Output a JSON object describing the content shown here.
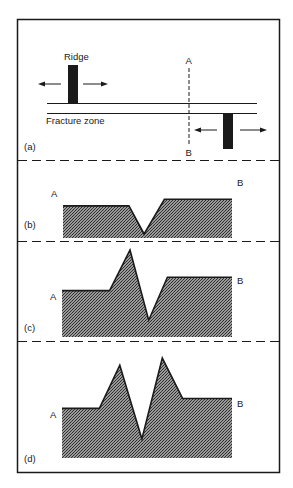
{
  "figure": {
    "panel_a": {
      "label": "(a)",
      "ridge_label": "Ridge",
      "fracture_zone_label": "Fracture zone",
      "profile_start_label": "A",
      "profile_end_label": "B"
    },
    "panel_b": {
      "label": "(b)",
      "start_label": "A",
      "end_label": "B",
      "profile": [
        [
          0,
          0.55
        ],
        [
          0.39,
          0.55
        ],
        [
          0.48,
          0.0
        ],
        [
          0.6,
          0.68
        ],
        [
          1.0,
          0.68
        ]
      ]
    },
    "panel_c": {
      "label": "(c)",
      "start_label": "A",
      "end_label": "B",
      "profile": [
        [
          0,
          0.48
        ],
        [
          0.28,
          0.48
        ],
        [
          0.4,
          1.0
        ],
        [
          0.51,
          0.1
        ],
        [
          0.62,
          0.65
        ],
        [
          1.0,
          0.65
        ]
      ]
    },
    "panel_d": {
      "label": "(d)",
      "start_label": "A",
      "end_label": "B",
      "profile": [
        [
          0,
          0.44
        ],
        [
          0.22,
          0.44
        ],
        [
          0.34,
          0.92
        ],
        [
          0.47,
          0.1
        ],
        [
          0.59,
          1.0
        ],
        [
          0.71,
          0.55
        ],
        [
          1.0,
          0.55
        ]
      ]
    },
    "colors": {
      "ink": "#1a1a1a",
      "fill": "#6e6e6e",
      "background": "#ffffff"
    }
  }
}
